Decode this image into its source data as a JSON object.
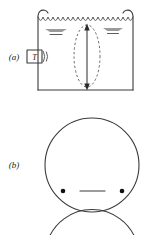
{
  "figure": {
    "background_color": "#ffffff",
    "ink_color": "#3a3a3a",
    "shade_color": "#9a9a9a",
    "dot_color": "#111111"
  },
  "panels": [
    {
      "id": "a",
      "label": "(a)",
      "label_x": 14,
      "label_y": 60,
      "description": "Open-topped liquid container with transducer on left wall, rippled free surface, dashed ellipse and vertical double-headed arrow through the bulk"
    },
    {
      "id": "b",
      "label": "(b)",
      "label_x": 14,
      "label_y": 168,
      "description": "Large circle containing two filled dots near the lower left and lower right and a short horizontal bar centered between them"
    }
  ],
  "panel_a": {
    "container": {
      "left_wall_x": 38,
      "right_wall_x": 133,
      "top_y": 10,
      "bottom_y": 90,
      "lip_radius": 6
    },
    "water_surface": {
      "label": "rippled-water-surface",
      "y": 20,
      "wave_count": 9,
      "wave_amplitude": 3,
      "left_x": 42,
      "right_x": 130
    },
    "transducer": {
      "label": "T",
      "name": "transducer-box",
      "box_x": 27,
      "box_y": 50,
      "box_w": 15,
      "box_h": 13,
      "wave_arcs": 2
    },
    "shade_markers": [
      {
        "name": "shade-marker-left",
        "cx": 56,
        "cy": 31,
        "rx": 11,
        "ry": 2.4
      },
      {
        "name": "shade-marker-right",
        "cx": 113,
        "cy": 30,
        "rx": 10,
        "ry": 2.2
      }
    ],
    "dashed_ellipse": {
      "name": "dashed-ellipse",
      "cx": 87,
      "cy": 56,
      "rx": 13,
      "ry": 31
    },
    "double_arrow": {
      "name": "vertical-double-arrow",
      "x": 87,
      "top_y": 25,
      "bottom_y": 89
    }
  },
  "panel_b": {
    "circle": {
      "name": "main-circle",
      "cx": 92,
      "cy": 165,
      "r": 47
    },
    "dots": [
      {
        "name": "dot-left",
        "cx": 63,
        "cy": 191,
        "r": 2.3
      },
      {
        "name": "dot-right",
        "cx": 122,
        "cy": 191,
        "r": 2.3
      }
    ],
    "bar": {
      "name": "horizontal-bar",
      "x1": 80,
      "x2": 105,
      "y": 191
    },
    "lower_arc": {
      "name": "partial-circle-below",
      "cx": 92,
      "cy": 262,
      "r": 47
    }
  }
}
